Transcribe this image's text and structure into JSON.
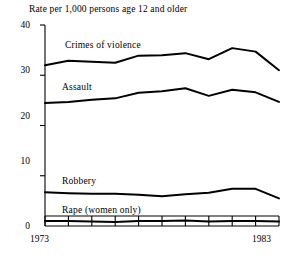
{
  "chart_data": {
    "type": "line",
    "title": "Rate per 1,000 persons age 12 and older",
    "xlabel": "",
    "ylabel": "",
    "xlim": [
      1973,
      1983
    ],
    "ylim": [
      0,
      40
    ],
    "yticks": [
      0,
      10,
      20,
      30,
      40
    ],
    "ytick_labels": [
      "0",
      "10",
      "20",
      "30",
      "40"
    ],
    "xticks": [
      1973,
      1974,
      1975,
      1976,
      1977,
      1978,
      1979,
      1980,
      1981,
      1982,
      1983
    ],
    "xtick_labels_shown": [
      "1973",
      "1983"
    ],
    "x": [
      1973,
      1974,
      1975,
      1976,
      1977,
      1978,
      1979,
      1980,
      1981,
      1982,
      1983
    ],
    "grid": false,
    "legend": "inline-labels",
    "series": [
      {
        "name": "Crimes of violence",
        "label": "Crimes of violence",
        "values": [
          32.0,
          32.9,
          32.7,
          32.5,
          33.9,
          34.0,
          34.4,
          33.2,
          35.4,
          34.7,
          31.0
        ]
      },
      {
        "name": "Assault",
        "label": "Assault",
        "values": [
          24.5,
          24.7,
          25.1,
          25.4,
          26.5,
          26.8,
          27.4,
          25.9,
          27.1,
          26.6,
          24.7
        ]
      },
      {
        "name": "Robbery",
        "label": "Robbery",
        "values": [
          6.7,
          6.5,
          6.4,
          6.4,
          6.2,
          5.9,
          6.3,
          6.6,
          7.4,
          7.4,
          5.5
        ]
      },
      {
        "name": "Rape (women only)",
        "label": "Rape (women only)",
        "values": [
          1.0,
          1.0,
          0.9,
          0.8,
          1.0,
          1.0,
          1.1,
          0.9,
          1.0,
          1.0,
          0.9
        ]
      }
    ],
    "footnote": ""
  },
  "axis": {
    "y_labels": [
      "40",
      "30",
      "20",
      "10",
      "0"
    ],
    "x_start_label": "1973",
    "x_end_label": "1983"
  },
  "labels": {
    "violence": "Crimes of violence",
    "assault": "Assault",
    "robbery": "Robbery",
    "rape": "Rape (women only)"
  }
}
